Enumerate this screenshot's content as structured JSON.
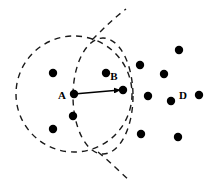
{
  "figure": {
    "background_color": "#ffffff",
    "stroke_color": "#1a1a1a",
    "point_color": "#000000",
    "width": 213,
    "height": 187
  },
  "labels": [
    {
      "name": "label-a",
      "text": "A",
      "x": 62,
      "y": 99
    },
    {
      "name": "label-b",
      "text": "B",
      "x": 114,
      "y": 80
    },
    {
      "name": "label-d",
      "text": "D",
      "x": 183,
      "y": 99
    }
  ],
  "labeled_points": [
    {
      "name": "point-a",
      "label": "A",
      "x": 74,
      "y": 94,
      "r": 4.2
    },
    {
      "name": "point-b",
      "label": "B",
      "x": 123,
      "y": 90,
      "r": 4.2
    },
    {
      "name": "point-d",
      "label": "D",
      "x": 199,
      "y": 95,
      "r": 4.2
    }
  ],
  "points": [
    {
      "name": "point-1",
      "x": 53,
      "y": 73,
      "r": 4.2
    },
    {
      "name": "point-2",
      "x": 106,
      "y": 73,
      "r": 4.2
    },
    {
      "name": "point-3",
      "x": 73,
      "y": 116,
      "r": 4.2
    },
    {
      "name": "point-4",
      "x": 53,
      "y": 129,
      "r": 4.2
    },
    {
      "name": "point-5",
      "x": 140,
      "y": 65,
      "r": 4.2
    },
    {
      "name": "point-6",
      "x": 179,
      "y": 50,
      "r": 4.2
    },
    {
      "name": "point-7",
      "x": 164,
      "y": 74,
      "r": 4.2
    },
    {
      "name": "point-8",
      "x": 148,
      "y": 96,
      "r": 4.2
    },
    {
      "name": "point-9",
      "x": 171,
      "y": 101,
      "r": 4.2
    },
    {
      "name": "point-10",
      "x": 141,
      "y": 134,
      "r": 4.2
    },
    {
      "name": "point-11",
      "x": 178,
      "y": 137,
      "r": 4.2
    }
  ],
  "shapes": {
    "circle_a": {
      "name": "dashed-circle-a",
      "cx": 74,
      "cy": 94,
      "r": 58,
      "dash": "6 5",
      "stroke_width": 1.4
    },
    "ellipse_b": {
      "name": "dashed-circle-b",
      "cx": 103,
      "cy": 96,
      "rx": 30,
      "ry": 58,
      "dash": "6 5",
      "stroke_width": 1.4
    },
    "arc_tail": {
      "name": "dashed-arc-tail",
      "path": "M 92 40 C 104 28 114 18 126 9",
      "dash": "6 5",
      "stroke_width": 1.4
    },
    "arc_tail_lower": {
      "name": "dashed-arc-tail-lower",
      "path": "M 98 152 C 110 162 120 172 130 181",
      "dash": "6 5",
      "stroke_width": 1.4
    },
    "vector_ab": {
      "name": "vector-a-to-b",
      "x1": 74,
      "y1": 94,
      "x2": 123,
      "y2": 90,
      "stroke_width": 1.3,
      "arrowhead": "filled-triangle"
    }
  }
}
